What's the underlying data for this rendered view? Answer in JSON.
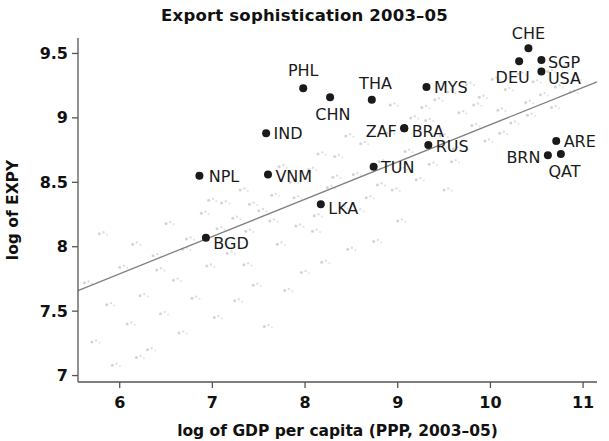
{
  "chart_data": {
    "type": "scatter",
    "title": "Export sophistication 2003–05",
    "xlabel": "log of GDP per capita (PPP, 2003–05)",
    "ylabel": "log of EXPY",
    "xlim": [
      5.55,
      11.15
    ],
    "ylim": [
      6.95,
      9.62
    ],
    "xticks": [
      6,
      7,
      8,
      9,
      10,
      11
    ],
    "xtick_labels": [
      "6",
      "7",
      "8",
      "9",
      "10",
      "11"
    ],
    "yticks": [
      7,
      7.5,
      8,
      8.5,
      9,
      9.5
    ],
    "ytick_labels": [
      "7",
      "7.5",
      "8",
      "8.5",
      "9",
      "9.5"
    ],
    "grid": false,
    "legend": null,
    "point_color": "#1a1a1a",
    "faint_point_color": "#d2d2d2",
    "trendline_color": "#808080",
    "trendline": {
      "x0": 5.55,
      "y0": 7.66,
      "x1": 11.15,
      "y1": 9.28
    },
    "labeled_points": [
      {
        "code": "NPL",
        "x": 6.86,
        "y": 8.55,
        "lx": 6.96,
        "ly": 8.55,
        "anchor": "start"
      },
      {
        "code": "BGD",
        "x": 6.93,
        "y": 8.07,
        "lx": 7.01,
        "ly": 8.03,
        "anchor": "start"
      },
      {
        "code": "IND",
        "x": 7.58,
        "y": 8.88,
        "lx": 7.66,
        "ly": 8.88,
        "anchor": "start"
      },
      {
        "code": "VNM",
        "x": 7.6,
        "y": 8.56,
        "lx": 7.68,
        "ly": 8.55,
        "anchor": "start"
      },
      {
        "code": "PHL",
        "x": 7.98,
        "y": 9.23,
        "lx": 7.98,
        "ly": 9.37,
        "anchor": "middle"
      },
      {
        "code": "LKA",
        "x": 8.17,
        "y": 8.33,
        "lx": 8.25,
        "ly": 8.3,
        "anchor": "start"
      },
      {
        "code": "CHN",
        "x": 8.27,
        "y": 9.16,
        "lx": 8.3,
        "ly": 9.03,
        "anchor": "middle"
      },
      {
        "code": "THA",
        "x": 8.72,
        "y": 9.14,
        "lx": 8.76,
        "ly": 9.27,
        "anchor": "middle"
      },
      {
        "code": "TUN",
        "x": 8.74,
        "y": 8.62,
        "lx": 8.82,
        "ly": 8.62,
        "anchor": "start"
      },
      {
        "code": "ZAF",
        "x": 9.07,
        "y": 8.92,
        "lx": 8.99,
        "ly": 8.9,
        "anchor": "end"
      },
      {
        "code": "BRA",
        "x": 9.07,
        "y": 8.92,
        "lx": 9.15,
        "ly": 8.9,
        "anchor": "start"
      },
      {
        "code": "RUS",
        "x": 9.33,
        "y": 8.79,
        "lx": 9.41,
        "ly": 8.78,
        "anchor": "start"
      },
      {
        "code": "MYS",
        "x": 9.31,
        "y": 9.24,
        "lx": 9.39,
        "ly": 9.24,
        "anchor": "start"
      },
      {
        "code": "DEU",
        "x": 10.31,
        "y": 9.44,
        "lx": 10.24,
        "ly": 9.32,
        "anchor": "middle"
      },
      {
        "code": "CHE",
        "x": 10.41,
        "y": 9.54,
        "lx": 10.41,
        "ly": 9.66,
        "anchor": "middle"
      },
      {
        "code": "SGP",
        "x": 10.55,
        "y": 9.45,
        "lx": 10.62,
        "ly": 9.43,
        "anchor": "start"
      },
      {
        "code": "USA",
        "x": 10.55,
        "y": 9.36,
        "lx": 10.62,
        "ly": 9.31,
        "anchor": "start"
      },
      {
        "code": "BRN",
        "x": 10.62,
        "y": 8.71,
        "lx": 10.54,
        "ly": 8.7,
        "anchor": "end"
      },
      {
        "code": "ARE",
        "x": 10.71,
        "y": 8.82,
        "lx": 10.79,
        "ly": 8.82,
        "anchor": "start"
      },
      {
        "code": "QAT",
        "x": 10.76,
        "y": 8.72,
        "lx": 10.8,
        "ly": 8.59,
        "anchor": "middle"
      }
    ],
    "background_points": [
      {
        "x": 5.62,
        "y": 7.72
      },
      {
        "x": 5.7,
        "y": 7.26
      },
      {
        "x": 5.78,
        "y": 8.1
      },
      {
        "x": 5.86,
        "y": 7.55
      },
      {
        "x": 5.92,
        "y": 7.08
      },
      {
        "x": 6.0,
        "y": 7.84
      },
      {
        "x": 6.08,
        "y": 7.4
      },
      {
        "x": 6.14,
        "y": 8.02
      },
      {
        "x": 6.22,
        "y": 7.62
      },
      {
        "x": 6.3,
        "y": 7.2
      },
      {
        "x": 6.36,
        "y": 7.93
      },
      {
        "x": 6.44,
        "y": 7.48
      },
      {
        "x": 6.5,
        "y": 8.18
      },
      {
        "x": 6.58,
        "y": 7.74
      },
      {
        "x": 6.64,
        "y": 7.33
      },
      {
        "x": 6.72,
        "y": 8.06
      },
      {
        "x": 6.78,
        "y": 7.6
      },
      {
        "x": 6.88,
        "y": 8.26
      },
      {
        "x": 6.94,
        "y": 7.85
      },
      {
        "x": 7.02,
        "y": 7.45
      },
      {
        "x": 7.1,
        "y": 8.34
      },
      {
        "x": 7.16,
        "y": 7.95
      },
      {
        "x": 7.24,
        "y": 7.58
      },
      {
        "x": 7.3,
        "y": 8.44
      },
      {
        "x": 7.36,
        "y": 8.12
      },
      {
        "x": 7.44,
        "y": 7.7
      },
      {
        "x": 7.5,
        "y": 8.28
      },
      {
        "x": 7.56,
        "y": 7.38
      },
      {
        "x": 7.64,
        "y": 8.4
      },
      {
        "x": 7.7,
        "y": 8.02
      },
      {
        "x": 7.78,
        "y": 7.66
      },
      {
        "x": 7.84,
        "y": 8.5
      },
      {
        "x": 7.9,
        "y": 8.16
      },
      {
        "x": 7.96,
        "y": 7.8
      },
      {
        "x": 8.04,
        "y": 8.6
      },
      {
        "x": 8.1,
        "y": 8.24
      },
      {
        "x": 8.18,
        "y": 7.88
      },
      {
        "x": 8.24,
        "y": 8.46
      },
      {
        "x": 8.32,
        "y": 8.7
      },
      {
        "x": 8.38,
        "y": 8.3
      },
      {
        "x": 8.46,
        "y": 7.98
      },
      {
        "x": 8.52,
        "y": 8.56
      },
      {
        "x": 8.6,
        "y": 8.8
      },
      {
        "x": 8.66,
        "y": 8.38
      },
      {
        "x": 8.74,
        "y": 8.04
      },
      {
        "x": 8.8,
        "y": 8.66
      },
      {
        "x": 8.88,
        "y": 8.88
      },
      {
        "x": 8.94,
        "y": 8.44
      },
      {
        "x": 9.0,
        "y": 8.2
      },
      {
        "x": 9.08,
        "y": 8.74
      },
      {
        "x": 9.14,
        "y": 9.0
      },
      {
        "x": 9.2,
        "y": 8.52
      },
      {
        "x": 9.26,
        "y": 9.08
      },
      {
        "x": 9.34,
        "y": 8.64
      },
      {
        "x": 9.4,
        "y": 9.14
      },
      {
        "x": 9.46,
        "y": 8.86
      },
      {
        "x": 9.54,
        "y": 9.2
      },
      {
        "x": 9.6,
        "y": 8.76
      },
      {
        "x": 9.66,
        "y": 9.04
      },
      {
        "x": 9.74,
        "y": 9.26
      },
      {
        "x": 9.8,
        "y": 8.94
      },
      {
        "x": 9.88,
        "y": 9.16
      },
      {
        "x": 9.94,
        "y": 8.82
      },
      {
        "x": 10.02,
        "y": 9.3
      },
      {
        "x": 10.08,
        "y": 9.06
      },
      {
        "x": 10.16,
        "y": 9.22
      },
      {
        "x": 10.22,
        "y": 8.96
      },
      {
        "x": 10.3,
        "y": 9.34
      },
      {
        "x": 10.38,
        "y": 9.12
      },
      {
        "x": 10.46,
        "y": 9.28
      },
      {
        "x": 10.54,
        "y": 9.18
      },
      {
        "x": 10.62,
        "y": 9.36
      },
      {
        "x": 10.7,
        "y": 9.24
      },
      {
        "x": 10.8,
        "y": 9.4
      },
      {
        "x": 10.9,
        "y": 9.3
      },
      {
        "x": 7.05,
        "y": 8.14
      },
      {
        "x": 7.22,
        "y": 8.22
      },
      {
        "x": 7.4,
        "y": 8.33
      },
      {
        "x": 7.62,
        "y": 8.2
      },
      {
        "x": 7.88,
        "y": 8.38
      },
      {
        "x": 8.08,
        "y": 8.12
      },
      {
        "x": 8.3,
        "y": 8.54
      },
      {
        "x": 8.55,
        "y": 8.28
      },
      {
        "x": 8.78,
        "y": 8.48
      },
      {
        "x": 9.02,
        "y": 8.6
      },
      {
        "x": 9.3,
        "y": 8.98
      },
      {
        "x": 9.58,
        "y": 8.66
      },
      {
        "x": 9.82,
        "y": 9.1
      },
      {
        "x": 10.1,
        "y": 8.88
      },
      {
        "x": 10.4,
        "y": 9.02
      },
      {
        "x": 6.4,
        "y": 7.82
      },
      {
        "x": 6.68,
        "y": 7.98
      },
      {
        "x": 6.96,
        "y": 8.36
      },
      {
        "x": 7.34,
        "y": 7.86
      },
      {
        "x": 7.72,
        "y": 8.62
      },
      {
        "x": 8.14,
        "y": 8.72
      },
      {
        "x": 8.44,
        "y": 8.86
      },
      {
        "x": 8.92,
        "y": 9.1
      },
      {
        "x": 9.5,
        "y": 8.44
      },
      {
        "x": 10.66,
        "y": 9.08
      },
      {
        "x": 10.86,
        "y": 9.2
      },
      {
        "x": 6.18,
        "y": 7.14
      }
    ]
  }
}
